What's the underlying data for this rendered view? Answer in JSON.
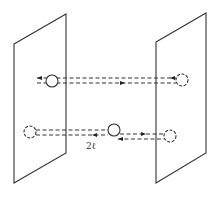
{
  "diagram": {
    "colors": {
      "stroke": "#333333",
      "background": "#ffffff"
    },
    "planes": [
      {
        "id": "left-plane",
        "points": [
          [
            14,
            44
          ],
          [
            66,
            14
          ],
          [
            66,
            153
          ],
          [
            14,
            183
          ]
        ]
      },
      {
        "id": "right-plane",
        "points": [
          [
            156,
            42
          ],
          [
            206,
            13
          ],
          [
            206,
            153
          ],
          [
            156,
            183
          ]
        ]
      }
    ],
    "atoms": [
      {
        "id": "upper-left-atom",
        "cx": 52,
        "cy": 81,
        "r": 6
      },
      {
        "id": "upper-right-atom",
        "cx": 182,
        "cy": 80,
        "r": 6,
        "style": "dashed"
      },
      {
        "id": "lower-left-atom",
        "cx": 30,
        "cy": 132,
        "r": 6,
        "style": "dashed"
      },
      {
        "id": "lower-middle-atom",
        "cx": 114,
        "cy": 130,
        "r": 6
      },
      {
        "id": "lower-right-atom",
        "cx": 170,
        "cy": 136,
        "r": 6,
        "style": "dashed"
      }
    ],
    "label": {
      "text": "2ℓ",
      "x": 86,
      "y": 149
    }
  }
}
